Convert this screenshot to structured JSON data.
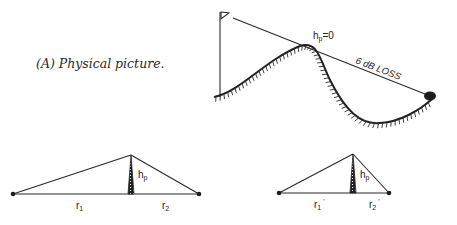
{
  "figure": {
    "caption": "(A) Physical picture.",
    "physical": {
      "peak_label": "h",
      "peak_label_sub": "p",
      "peak_label_rest": "=0",
      "loss_label": "6 dB LOSS"
    },
    "triangle_1": {
      "height_label": "h",
      "height_label_sub": "p",
      "left_label": "r",
      "left_label_sub": "1",
      "right_label": "r",
      "right_label_sub": "2"
    },
    "triangle_2": {
      "height_label": "h",
      "height_label_sub": "p",
      "left_label": "r",
      "left_label_sub": "1",
      "left_label_prime": "'",
      "right_label": "r",
      "right_label_sub": "2",
      "right_label_prime": "'"
    }
  },
  "colors": {
    "ink": "#2a2a2a",
    "background": "#ffffff"
  }
}
